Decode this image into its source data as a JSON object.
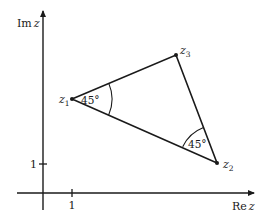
{
  "axes": {
    "x_label_prefix": "Re",
    "x_label_var": "z",
    "y_label_prefix": "Im",
    "y_label_var": "z",
    "x_tick_label": "1",
    "y_tick_label": "1"
  },
  "points": [
    {
      "name": "z",
      "sub": "1"
    },
    {
      "name": "z",
      "sub": "2"
    },
    {
      "name": "z",
      "sub": "3"
    }
  ],
  "angles": [
    {
      "vertex": "z1",
      "label": "45°"
    },
    {
      "vertex": "z2",
      "label": "45°"
    }
  ],
  "colors": {
    "stroke": "#1a1a1a",
    "background": "#ffffff"
  }
}
